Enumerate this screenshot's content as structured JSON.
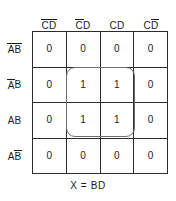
{
  "figure": {
    "type": "karnaugh-map",
    "variables": [
      "A",
      "B",
      "C",
      "D"
    ],
    "caption": "X = BD"
  },
  "columns": [
    {
      "id": "col-0",
      "label": "CD",
      "plain": "C'D'",
      "overbars": [
        "C",
        "D"
      ]
    },
    {
      "id": "col-1",
      "label": "CD",
      "plain": "C'D",
      "overbars": [
        "C"
      ]
    },
    {
      "id": "col-2",
      "label": "CD",
      "plain": "CD",
      "overbars": []
    },
    {
      "id": "col-3",
      "label": "CD",
      "plain": "CD'",
      "overbars": [
        "D"
      ]
    }
  ],
  "rows": [
    {
      "id": "row-0",
      "label": "AB",
      "plain": "A'B'",
      "overbars": [
        "A",
        "B"
      ]
    },
    {
      "id": "row-1",
      "label": "AB",
      "plain": "A'B",
      "overbars": [
        "A"
      ]
    },
    {
      "id": "row-2",
      "label": "AB",
      "plain": "AB",
      "overbars": []
    },
    {
      "id": "row-3",
      "label": "AB",
      "plain": "AB'",
      "overbars": [
        "B"
      ]
    }
  ],
  "cells": [
    [
      "0",
      "0",
      "0",
      "0"
    ],
    [
      "0",
      "1",
      "1",
      "0"
    ],
    [
      "0",
      "1",
      "1",
      "0"
    ],
    [
      "0",
      "0",
      "0",
      "0"
    ]
  ],
  "group": {
    "name": "group-bd",
    "term": "BD",
    "covers_rows": [
      1,
      2
    ],
    "covers_columns": [
      1,
      2
    ],
    "size": 4
  },
  "colors": {
    "grid_line": "#2b2b2b",
    "group_outline": "#6f6f6f",
    "text": "#1a1a1a",
    "background": "#ffffff"
  }
}
